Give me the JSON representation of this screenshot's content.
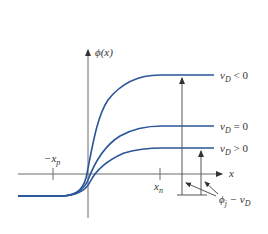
{
  "diagram": {
    "y_axis_label": "ϕ(x)",
    "x_axis_label": "x",
    "ticks": {
      "left": {
        "main": "−x",
        "sub": "p"
      },
      "right": {
        "main": "x",
        "sub": "n"
      }
    },
    "curves": [
      {
        "name": "reverse-bias",
        "label_main": "v",
        "label_sub": "D",
        "label_rel": " < 0",
        "level": "high"
      },
      {
        "name": "zero-bias",
        "label_main": "v",
        "label_sub": "D",
        "label_rel": " = 0",
        "level": "mid"
      },
      {
        "name": "forward-bias",
        "label_main": "v",
        "label_sub": "D",
        "label_rel": " > 0",
        "level": "low"
      }
    ],
    "annotation": {
      "main": "ϕ",
      "sub": "j",
      "rest": " − v",
      "rest_sub": "D"
    },
    "colors": {
      "curve": "#2a5599",
      "axis": "#6a6a6a",
      "text": "#333333"
    }
  }
}
